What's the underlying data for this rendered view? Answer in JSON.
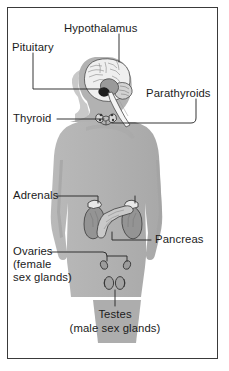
{
  "figure": {
    "border_color": "#3a3a3a",
    "background_color": "#ffffff",
    "body_fill": "#b4b4b4",
    "body_shadow": "#9a9a9a",
    "gland_fill": "#8d8d8d",
    "leader_color": "#2a2a2a",
    "text_color": "#1b1b1b"
  },
  "labels": {
    "hypothalamus": "Hypothalamus",
    "pituitary": "Pituitary",
    "parathyroids": "Parathyroids",
    "thyroid": "Thyroid",
    "adrenals": "Adrenals",
    "pancreas": "Pancreas",
    "ovaries_line1": "Ovaries",
    "ovaries_line2": "(female",
    "ovaries_line3": "sex glands)",
    "testes_line1": "Testes",
    "testes_line2": "(male sex glands)"
  },
  "glands": [
    {
      "name": "hypothalamus",
      "label": "Hypothalamus",
      "region": "brain"
    },
    {
      "name": "pituitary",
      "label": "Pituitary",
      "region": "brain"
    },
    {
      "name": "parathyroids",
      "label": "Parathyroids",
      "region": "neck"
    },
    {
      "name": "thyroid",
      "label": "Thyroid",
      "region": "neck"
    },
    {
      "name": "adrenals",
      "label": "Adrenals",
      "region": "abdomen"
    },
    {
      "name": "pancreas",
      "label": "Pancreas",
      "region": "abdomen"
    },
    {
      "name": "ovaries",
      "label": "Ovaries (female sex glands)",
      "region": "pelvis"
    },
    {
      "name": "testes",
      "label": "Testes (male sex glands)",
      "region": "pelvis"
    }
  ]
}
